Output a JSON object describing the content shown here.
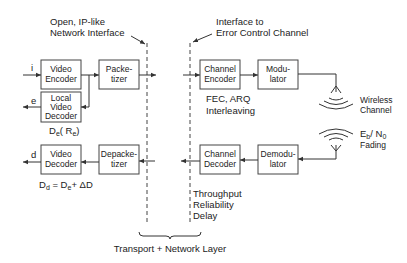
{
  "annotations": {
    "open_interface": [
      "Open, IP-like",
      "Network Interface"
    ],
    "error_control_interface": [
      "Interface to",
      "Error Control Channel"
    ],
    "fec_arq": [
      "FEC, ARQ",
      "Interleaving"
    ],
    "wireless_channel": [
      "Wireless",
      "Channel"
    ],
    "eb_n0": {
      "E": "E",
      "b": "b",
      "slash": "/ N",
      "zero": "0"
    },
    "fading": "Fading",
    "qos": [
      "Throughput",
      "Reliability",
      "Delay"
    ],
    "layer": "Transport + Network Layer",
    "encoder_distortion": "Dₑ( Rₑ)",
    "decoder_distortion": "Dₑ = Dₑ+ ΔD"
  },
  "signals": {
    "input": "i",
    "local_output": "e",
    "decoded_output": "d"
  },
  "distortion": {
    "enc_D": "D",
    "enc_sub": "e",
    "enc_R": "( R",
    "enc_Rsub": "e",
    "enc_close": ")",
    "dec_D": "D",
    "dec_sub": "d",
    "dec_eq": " = D",
    "dec_sub2": "e",
    "dec_rest": "+ ΔD"
  },
  "blocks": {
    "video_encoder": [
      "Video",
      "Encoder"
    ],
    "local_video_decoder": [
      "Local",
      "Video",
      "Decoder"
    ],
    "packetizer": [
      "Packe-",
      "tizer"
    ],
    "channel_encoder": [
      "Channel",
      "Encoder"
    ],
    "modulator": [
      "Modu-",
      "lator"
    ],
    "video_decoder": [
      "Video",
      "Decoder"
    ],
    "depacketizer": [
      "Depacke-",
      "tizer"
    ],
    "channel_decoder": [
      "Channel",
      "Decoder"
    ],
    "demodulator": [
      "Demodu-",
      "lator"
    ]
  }
}
